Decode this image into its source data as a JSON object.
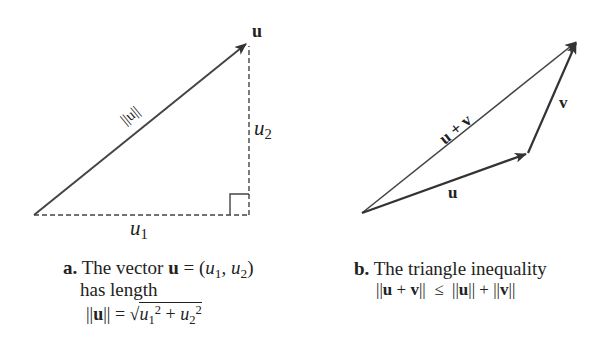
{
  "figure_a": {
    "vector_label": "u",
    "norm_label": "||u||",
    "u1_base": "u",
    "u1_sub": "1",
    "u2_base": "u",
    "u2_sub": "2",
    "caption": {
      "letter": "a.",
      "line1_text": "The vector ",
      "line1_vec": "u",
      "line1_eq": " = (",
      "line1_u1": "u",
      "line1_u1_sub": "1",
      "line1_comma": ", ",
      "line1_u2": "u",
      "line1_u2_sub": "2",
      "line1_close": ")",
      "line2": "has length",
      "line3_bars_open": "||",
      "line3_vec": "u",
      "line3_bars_close": "|| = √",
      "line3_u1": "u",
      "line3_u1_sub": "1",
      "line3_sup1": "2",
      "line3_plus": " + ",
      "line3_u2": "u",
      "line3_u2_sub": "2",
      "line3_sup2": "2"
    }
  },
  "figure_b": {
    "sum_label": "u + v",
    "u_label": "u",
    "v_label": "v",
    "caption": {
      "letter": "b.",
      "title": "The triangle inequality",
      "ineq_parts": [
        "||",
        "u",
        " + ",
        "v",
        "||  ≤  ||",
        "u",
        "|| + ||",
        "v",
        "||"
      ]
    }
  },
  "colors": {
    "line": "#3a3a3a",
    "text": "#222222",
    "background": "#ffffff"
  }
}
